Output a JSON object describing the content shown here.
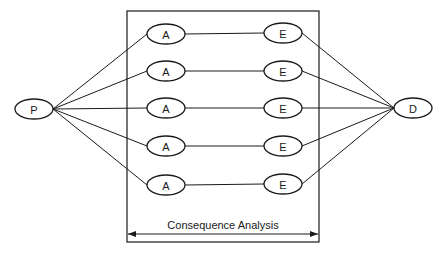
{
  "diagram": {
    "nodes": {
      "source": {
        "id": "P",
        "label": "P",
        "cx": 34,
        "cy": 109
      },
      "sink": {
        "id": "D",
        "label": "D",
        "cx": 413,
        "cy": 108
      },
      "a_nodes": [
        {
          "label": "A",
          "cx": 166,
          "cy": 34
        },
        {
          "label": "A",
          "cx": 166,
          "cy": 71
        },
        {
          "label": "A",
          "cx": 166,
          "cy": 108
        },
        {
          "label": "A",
          "cx": 166,
          "cy": 146
        },
        {
          "label": "A",
          "cx": 166,
          "cy": 185
        }
      ],
      "e_nodes": [
        {
          "label": "E",
          "cx": 283,
          "cy": 33
        },
        {
          "label": "E",
          "cx": 283,
          "cy": 71
        },
        {
          "label": "E",
          "cx": 283,
          "cy": 108
        },
        {
          "label": "E",
          "cx": 283,
          "cy": 146
        },
        {
          "label": "E",
          "cx": 283,
          "cy": 184
        }
      ]
    },
    "box": {
      "x1": 127,
      "y1": 11,
      "x2": 319,
      "y2": 242
    },
    "span_label": "Consequence Analysis",
    "line_color": "#1a1a1a"
  }
}
